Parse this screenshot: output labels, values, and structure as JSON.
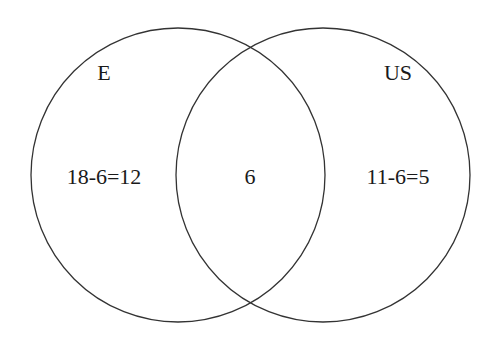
{
  "diagram": {
    "type": "venn",
    "stroke_color": "#333333",
    "background": "#ffffff",
    "sets": [
      {
        "name": "E",
        "label": "E"
      },
      {
        "name": "US",
        "label": "US"
      }
    ],
    "regions": {
      "only_e": "18-6=12",
      "intersection": "6",
      "only_us": "11-6=5"
    }
  }
}
